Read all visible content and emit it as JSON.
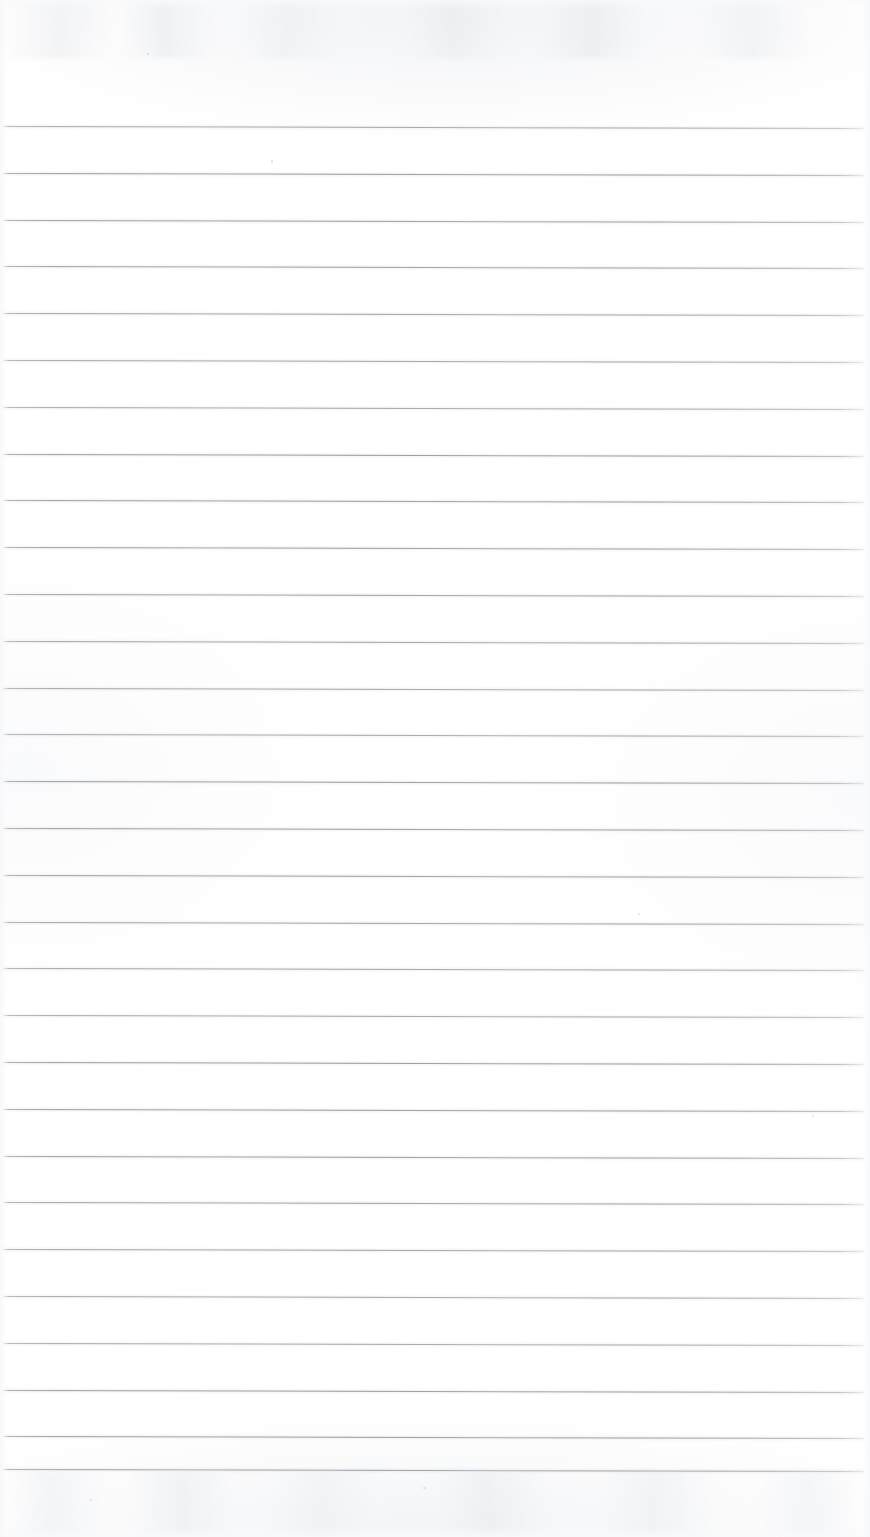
{
  "document": {
    "kind": "scanned-ruled-notebook-page",
    "title": "Blank Ruled Notebook Page",
    "content_text": "",
    "page_width": 870,
    "page_height": 1537,
    "background_color": "#ffffff",
    "rule_color": "#8d919a",
    "rule_thickness_px": 1,
    "has_vertical_margin_rule": false,
    "has_handwriting": false,
    "has_printed_text": false
  },
  "ruling": {
    "line_count": 30,
    "first_line_y": 126,
    "line_spacing_px": 46.8,
    "line_start_x": 3,
    "line_end_x": 864,
    "skew_degrees": 0.14,
    "y_positions": [
      126,
      172.8,
      219.6,
      266.4,
      313.2,
      360,
      406.8,
      453.6,
      500.4,
      547.2,
      594,
      640.8,
      687.6,
      734.4,
      781.2,
      828,
      874.8,
      921.6,
      968.4,
      1015.2,
      1062,
      1108.8,
      1155.6,
      1202.4,
      1249.2,
      1296,
      1342.8,
      1389.6,
      1436.4,
      1469
    ]
  },
  "artifacts": {
    "top_ghost_band": "faint scanner bleed-through ghosting",
    "bottom_ghost_band": "faint scanner bleed-through ghosting",
    "specks": [
      {
        "x": 147,
        "y": 53,
        "w": 2,
        "h": 2
      },
      {
        "x": 271,
        "y": 160,
        "w": 2,
        "h": 3
      },
      {
        "x": 638,
        "y": 913,
        "w": 2,
        "h": 2
      },
      {
        "x": 812,
        "y": 1115,
        "w": 2,
        "h": 2
      },
      {
        "x": 423,
        "y": 1487,
        "w": 3,
        "h": 2
      },
      {
        "x": 90,
        "y": 1499,
        "w": 2,
        "h": 2
      }
    ]
  }
}
